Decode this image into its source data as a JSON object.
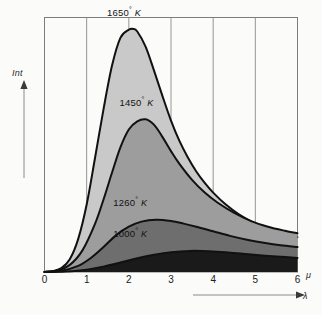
{
  "chart_data": {
    "type": "area",
    "title": "",
    "subtitle": "",
    "xlabel": "λ",
    "ylabel": "Int",
    "x_unit": "μ",
    "xlim": [
      0,
      6
    ],
    "ylim": [
      0,
      1
    ],
    "grid": "vertical gridlines at each integer wavelength; no horizontal gridlines",
    "legend_position": "inline labels placed above each curve peak",
    "x_ticks": [
      "0",
      "1",
      "2",
      "3",
      "4",
      "5",
      "6"
    ],
    "x_tick_values": [
      0,
      1,
      2,
      3,
      4,
      5,
      6
    ],
    "y_ticks": [],
    "series": [
      {
        "name": "1650° K",
        "temperature": 1650,
        "unit": "K",
        "fill": "#c9c9c9",
        "peak_x": 2.1,
        "peak_y": 0.955,
        "label_x": 2.05,
        "label_y": 1.0,
        "x": [
          0.0,
          0.2,
          0.4,
          0.6,
          0.8,
          1.0,
          1.2,
          1.4,
          1.6,
          1.8,
          2.0,
          2.1,
          2.2,
          2.4,
          2.6,
          2.8,
          3.0,
          3.2,
          3.4,
          3.6,
          3.8,
          4.0,
          4.3,
          4.6,
          5.0,
          5.4,
          5.7,
          6.0
        ],
        "y": [
          0.0,
          0.004,
          0.015,
          0.05,
          0.13,
          0.265,
          0.45,
          0.64,
          0.81,
          0.92,
          0.952,
          0.955,
          0.945,
          0.885,
          0.79,
          0.69,
          0.595,
          0.515,
          0.45,
          0.395,
          0.35,
          0.312,
          0.265,
          0.228,
          0.19,
          0.162,
          0.148,
          0.137
        ]
      },
      {
        "name": "1450° K",
        "temperature": 1450,
        "unit": "K",
        "fill": "#9d9d9d",
        "peak_x": 2.4,
        "peak_y": 0.6,
        "label_x": 2.35,
        "label_y": 0.645,
        "x": [
          0.0,
          0.3,
          0.6,
          0.9,
          1.2,
          1.4,
          1.6,
          1.8,
          2.0,
          2.2,
          2.4,
          2.6,
          2.8,
          3.0,
          3.2,
          3.5,
          3.8,
          4.1,
          4.5,
          4.9,
          5.3,
          5.7,
          6.0
        ],
        "y": [
          0.0,
          0.006,
          0.028,
          0.085,
          0.19,
          0.285,
          0.39,
          0.49,
          0.56,
          0.592,
          0.6,
          0.578,
          0.53,
          0.475,
          0.425,
          0.362,
          0.312,
          0.273,
          0.232,
          0.2,
          0.178,
          0.162,
          0.152
        ]
      },
      {
        "name": "1260° K",
        "temperature": 1260,
        "unit": "K",
        "fill": "#6e6e6e",
        "peak_x": 2.65,
        "peak_y": 0.205,
        "label_x": 2.2,
        "label_y": 0.25,
        "x": [
          0.0,
          0.4,
          0.8,
          1.1,
          1.4,
          1.7,
          2.0,
          2.3,
          2.65,
          3.0,
          3.3,
          3.6,
          4.0,
          4.4,
          4.8,
          5.2,
          5.6,
          6.0
        ],
        "y": [
          0.0,
          0.005,
          0.024,
          0.055,
          0.098,
          0.145,
          0.178,
          0.198,
          0.205,
          0.2,
          0.19,
          0.178,
          0.16,
          0.142,
          0.127,
          0.115,
          0.105,
          0.098
        ]
      },
      {
        "name": "1000° K",
        "temperature": 1000,
        "unit": "K",
        "fill": "#1a1a1a",
        "peak_x": 3.45,
        "peak_y": 0.083,
        "label_x": 2.2,
        "label_y": 0.13,
        "x": [
          0.0,
          0.5,
          1.0,
          1.4,
          1.8,
          2.2,
          2.6,
          3.0,
          3.45,
          3.9,
          4.3,
          4.7,
          5.1,
          5.5,
          6.0
        ],
        "y": [
          0.0,
          0.002,
          0.009,
          0.021,
          0.037,
          0.054,
          0.068,
          0.078,
          0.083,
          0.082,
          0.078,
          0.072,
          0.066,
          0.061,
          0.055
        ]
      }
    ]
  },
  "axes": {
    "y_caption": "Int",
    "x_caption": "λ",
    "x_unit": "μ",
    "ticks": [
      "0",
      "1",
      "2",
      "3",
      "4",
      "5",
      "6"
    ]
  },
  "labels": {
    "s1": {
      "value": "1650",
      "degree": "°",
      "kelvin": "K"
    },
    "s2": {
      "value": "1450",
      "degree": "°",
      "kelvin": "K"
    },
    "s3": {
      "value": "1260",
      "degree": "°",
      "kelvin": "K"
    },
    "s4": {
      "value": "1000",
      "degree": "°",
      "kelvin": "K"
    }
  },
  "colors": {
    "background": "#fbfbfa",
    "frame": "#7d7d7d",
    "gridline": "#8a8a8a",
    "curve_stroke": "#111111",
    "fill_1650": "#c9c9c9",
    "fill_1450": "#9d9d9d",
    "fill_1260": "#6e6e6e",
    "fill_1000": "#1a1a1a"
  }
}
